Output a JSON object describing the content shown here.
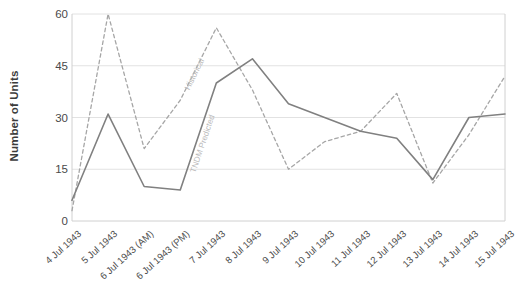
{
  "chart_data": {
    "type": "line",
    "title": "",
    "xlabel": "",
    "ylabel": "Number of Units",
    "ylim": [
      0,
      60
    ],
    "yticks": [
      0,
      15,
      30,
      45,
      60
    ],
    "grid": true,
    "legend_position": "inline-annotation",
    "categories": [
      "4 Jul 1943",
      "5 Jul 1943",
      "6 Jul 1943 (AM)",
      "6 Jul 1943 (PM)",
      "7 Jul 1943",
      "8 Jul 1943",
      "9 Jul 1943",
      "10 Jul 1943",
      "11 Jul 1943",
      "12 Jul 1943",
      "13 Jul 1943",
      "14 Jul 1943",
      "15 Jul 1943"
    ],
    "series": [
      {
        "name": "Historical",
        "style": "dashed",
        "color": "#a6a6a6",
        "values": [
          3,
          60,
          21,
          35,
          56,
          38,
          15,
          23,
          26,
          37,
          11,
          25,
          42
        ]
      },
      {
        "name": "TNDM Predicted",
        "style": "solid",
        "color": "#808080",
        "values": [
          6,
          31,
          10,
          9,
          40,
          47,
          34,
          30,
          26,
          24,
          12,
          30,
          31
        ]
      }
    ],
    "annotations": [
      {
        "text": "Historical",
        "series": "Historical"
      },
      {
        "text": "TNDM Predicted",
        "series": "TNDM Predicted"
      }
    ]
  },
  "axis": {
    "ytick_labels": [
      "0",
      "15",
      "30",
      "45",
      "60"
    ],
    "y_title": "Number of Units"
  },
  "colors": {
    "historical": "#a6a6a6",
    "tndm": "#808080",
    "grid": "#e2e2e2",
    "axis": "#d0d0d0",
    "text": "#4a4a4a"
  }
}
